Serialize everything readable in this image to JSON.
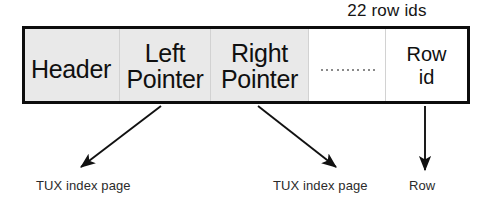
{
  "diagram": {
    "title_caption": "22 row ids",
    "box": {
      "cells": [
        {
          "id": "header",
          "label": "Header",
          "shaded": true,
          "width": 94
        },
        {
          "id": "left-pointer",
          "label": "Left\nPointer",
          "shaded": true,
          "width": 91
        },
        {
          "id": "right-pointer",
          "label": "Right\nPointer",
          "shaded": true,
          "width": 98
        },
        {
          "id": "ellipsis",
          "label": "",
          "shaded": false,
          "width": 77
        },
        {
          "id": "row-id",
          "label": "Row\nid",
          "shaded": false,
          "width": 82
        }
      ],
      "ellipsis_dot_count": 11
    },
    "annotations": [
      {
        "id": "left-pointer-target",
        "text": "TUX index page"
      },
      {
        "id": "right-pointer-target",
        "text": "TUX index page"
      },
      {
        "id": "row-id-target",
        "text": "Row"
      }
    ],
    "colors": {
      "border": "#0d0d0d",
      "shaded_cell": "#e9e9e9",
      "plain_cell": "#ffffff",
      "text": "#101010",
      "divider": "#d2d2d2",
      "arrow": "#111111"
    }
  }
}
